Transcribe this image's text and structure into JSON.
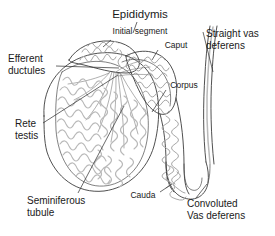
{
  "figure": {
    "background_color": "#ffffff",
    "line_color": "#3c3c3c",
    "tubule_color": "#b9b9b9",
    "text_color": "#1a1a1a"
  },
  "labels": {
    "epididymis": "Epididymis",
    "initial_segment": "Initial segment",
    "caput": "Caput",
    "corpus": "Corpus",
    "cauda": "Cauda",
    "efferent_ductules_line1": "Efferent",
    "efferent_ductules_line2": "ductules",
    "rete_testis_line1": "Rete",
    "rete_testis_line2": "testis",
    "seminiferous_tubule_line1": "Seminiferous",
    "seminiferous_tubule_line2": "tubule",
    "straight_vas_deferens_line1": "Straight vas",
    "straight_vas_deferens_line2": "deferens",
    "convoluted_vas_deferens_line1": "Convoluted",
    "convoluted_vas_deferens_line2": "Vas deferens"
  }
}
